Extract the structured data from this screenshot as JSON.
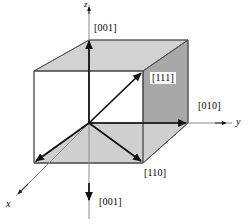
{
  "figure": {
    "type": "crystallographic-direction-diagram",
    "background_color": "#ffffff",
    "line_color": "#000000",
    "faces": {
      "top_face_color": "#d2d2d2",
      "bottom_face_color": "#cfcfcf",
      "right_face_upper_color": "#a8a8a8",
      "right_face_lower_color": "#686868",
      "left_face_color": "#ffffff",
      "edge_color": "#555555"
    }
  },
  "axes": [
    {
      "id": "x",
      "label": "x",
      "direction": "down-left",
      "style": "italic"
    },
    {
      "id": "y",
      "label": "y",
      "direction": "right",
      "style": "italic"
    },
    {
      "id": "z",
      "label": "z",
      "direction": "up",
      "style": "italic"
    }
  ],
  "direction_labels": [
    {
      "id": "z-positive",
      "text": "[001]",
      "boxed": false,
      "position": "upper-center"
    },
    {
      "id": "body-diagonal",
      "text": "[111]",
      "boxed": true,
      "position": "center-right"
    },
    {
      "id": "y-positive",
      "text": "[010]",
      "boxed": false,
      "position": "right"
    },
    {
      "id": "face-diagonal",
      "text": "[110]",
      "boxed": false,
      "position": "lower-center-right"
    },
    {
      "id": "z-negative",
      "text": "[001]",
      "boxed": false,
      "position": "bottom-center"
    }
  ],
  "vectors": [
    {
      "id": "vector-111",
      "label": "[111]",
      "from": "origin",
      "to": "front-top-right-vertex",
      "arrowhead": true
    },
    {
      "id": "vector-110",
      "label": "[110]",
      "from": "origin",
      "to": "front-bottom-right-vertex",
      "arrowhead": true
    },
    {
      "id": "vector-100-x",
      "label": "x",
      "from": "origin",
      "to": "front-bottom-left-vertex",
      "arrowhead": true
    },
    {
      "id": "vector-010-y",
      "label": "[010]",
      "from": "origin",
      "to": "right-face-center-edge",
      "arrowhead": true
    },
    {
      "id": "vector-001-up",
      "label": "[001]",
      "from": "origin",
      "to": "top-face-center",
      "arrowhead": true
    },
    {
      "id": "vector-001-down",
      "label": "[001]",
      "from": "origin",
      "to": "below-cube",
      "arrowhead": true
    }
  ]
}
